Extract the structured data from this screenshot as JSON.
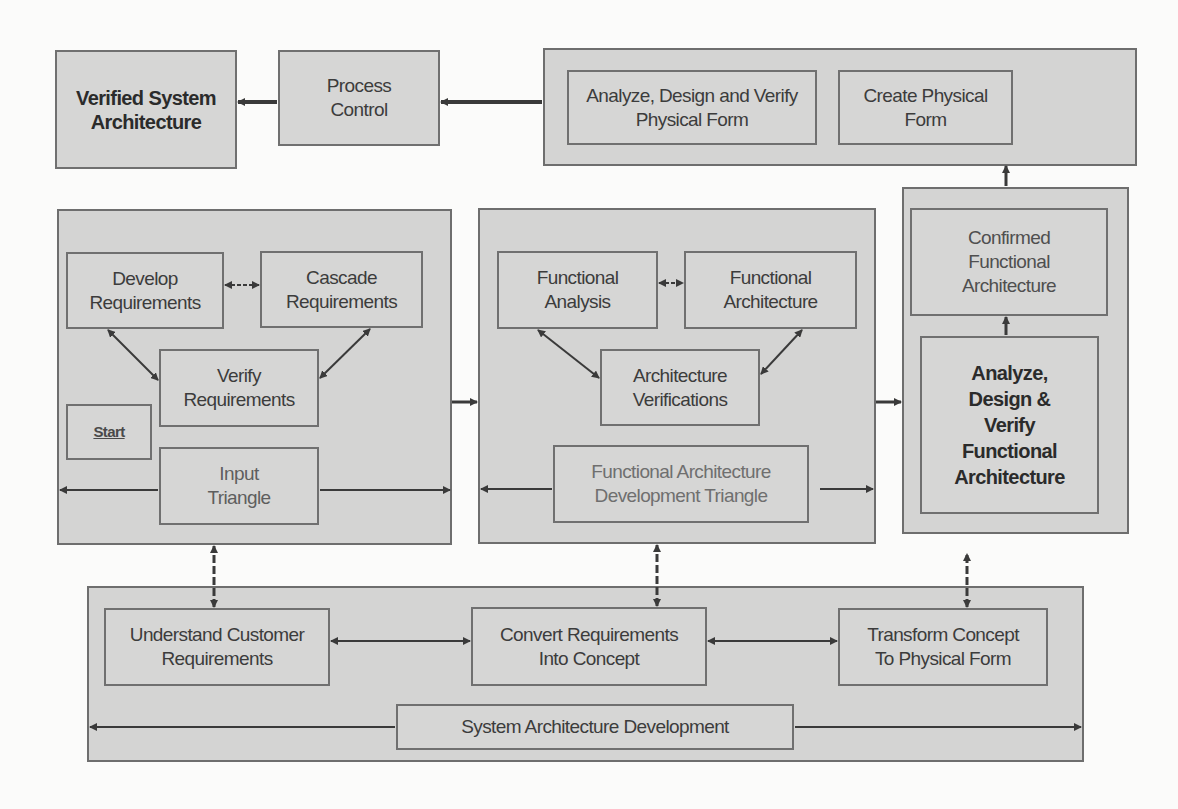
{
  "diagram": {
    "colors": {
      "box_fill": "#d4d4d3",
      "border": "#6e6e6e",
      "background": "#fbfbfa",
      "arrow": "#3a3a3a"
    },
    "top_row": {
      "verified_system_architecture": "Verified System\nArchitecture",
      "process_control": "Process\nControl",
      "physical_group": {
        "analyze_design_verify_physical": "Analyze, Design and Verify\nPhysical Form",
        "create_physical_form": "Create Physical\nForm"
      }
    },
    "input_triangle": {
      "develop_requirements": "Develop\nRequirements",
      "cascade_requirements": "Cascade\nRequirements",
      "verify_requirements": "Verify\nRequirements",
      "start": "Start",
      "label": "Input\nTriangle"
    },
    "functional_triangle": {
      "functional_analysis": "Functional\nAnalysis",
      "functional_architecture": "Functional\nArchitecture",
      "architecture_verifications": "Architecture\nVerifications",
      "label": "Functional Architecture\nDevelopment Triangle"
    },
    "functional_group": {
      "confirmed_functional_architecture": "Confirmed\nFunctional\nArchitecture",
      "analyze_design_verify_functional": "Analyze,\nDesign &\nVerify\nFunctional\nArchitecture"
    },
    "bottom_row": {
      "understand_customer_requirements": "Understand Customer\nRequirements",
      "convert_requirements_into_concept": "Convert Requirements\nInto Concept",
      "transform_concept_to_physical_form": "Transform Concept\nTo Physical Form",
      "label": "System Architecture Development"
    }
  }
}
